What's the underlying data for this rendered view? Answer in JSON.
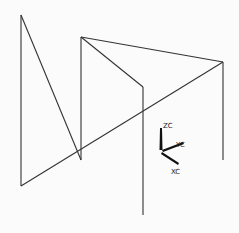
{
  "viewport": {
    "background": "#fbfbfb",
    "line_color": "#333333"
  },
  "wireframe": {
    "lines": [
      {
        "x1": 21,
        "y1": 15,
        "x2": 21,
        "y2": 186
      },
      {
        "x1": 21,
        "y1": 15,
        "x2": 81,
        "y2": 160
      },
      {
        "x1": 81,
        "y1": 37,
        "x2": 81,
        "y2": 160
      },
      {
        "x1": 81,
        "y1": 37,
        "x2": 223,
        "y2": 62
      },
      {
        "x1": 81,
        "y1": 37,
        "x2": 143,
        "y2": 87
      },
      {
        "x1": 143,
        "y1": 87,
        "x2": 143,
        "y2": 215
      },
      {
        "x1": 223,
        "y1": 62,
        "x2": 223,
        "y2": 160
      },
      {
        "x1": 21,
        "y1": 186,
        "x2": 223,
        "y2": 62
      }
    ]
  },
  "triad": {
    "zc_label": "ZC",
    "yc_label": "YC",
    "xc_label": "XC"
  }
}
